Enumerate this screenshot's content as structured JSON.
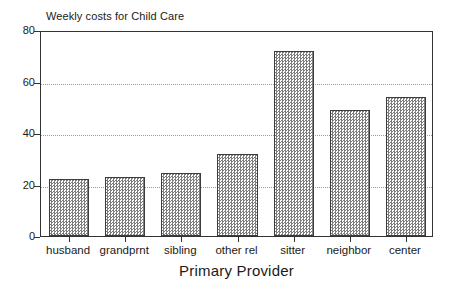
{
  "chart_data": {
    "type": "bar",
    "title": "Weekly costs for Child Care",
    "xlabel": "Primary Provider",
    "ylabel": "",
    "categories": [
      "husband",
      "grandprnt",
      "sibling",
      "other rel",
      "sitter",
      "neighbor",
      "center"
    ],
    "values": [
      22,
      23,
      24.5,
      32,
      72,
      49,
      54
    ],
    "ylim": [
      0,
      80
    ],
    "yticks": [
      0,
      20,
      40,
      60,
      80
    ],
    "ytick_labels": [
      "0",
      "20",
      "40",
      "60",
      "80"
    ],
    "grid": true,
    "gridlines_at": [
      20,
      40,
      60
    ],
    "legend": null,
    "legend_position": "none",
    "series": [
      {
        "name": "Weekly costs for Child Care",
        "values": [
          22,
          23,
          24.5,
          32,
          72,
          49,
          54
        ]
      }
    ],
    "bar_fill": "#7d7d7d",
    "bar_edge": "#3d3d3d",
    "frame_color": "#333333",
    "grid_color": "#9a9a9a",
    "background": "#ffffff"
  }
}
